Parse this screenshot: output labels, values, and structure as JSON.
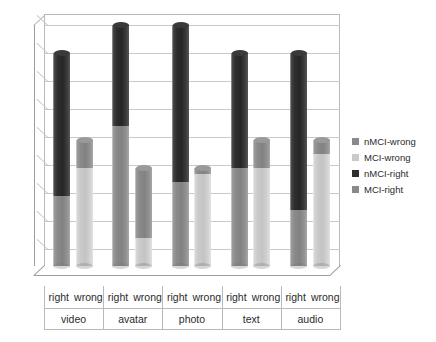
{
  "chart_data": {
    "type": "bar",
    "title": "",
    "xlabel": "",
    "ylabel": "",
    "ylim": [
      0,
      18
    ],
    "ytick_step": 2,
    "yticks": [
      18,
      16,
      14,
      12,
      10,
      8,
      6,
      4,
      2,
      0
    ],
    "grid": true,
    "stacked": true,
    "legend_position": "right",
    "groups": [
      "video",
      "avatar",
      "photo",
      "text",
      "audio"
    ],
    "subcategories": [
      "right",
      "wrong"
    ],
    "legend": [
      "nMCI-wrong",
      "MCI-wrong",
      "nMCI-right",
      "MCI-right"
    ],
    "series": [
      {
        "name": "MCI-right",
        "color": "#8a8a8a",
        "values": [
          5,
          0,
          10,
          0,
          6,
          0,
          7,
          0,
          4,
          0
        ]
      },
      {
        "name": "nMCI-right",
        "color": "#2e2e2e",
        "values": [
          10.2,
          0,
          7.2,
          0,
          11.2,
          0,
          8.2,
          0,
          11.2,
          0
        ]
      },
      {
        "name": "MCI-wrong",
        "color": "#cacaca",
        "values": [
          0,
          7,
          0,
          2,
          0,
          6.6,
          0,
          7,
          0,
          8
        ]
      },
      {
        "name": "nMCI-wrong",
        "color": "#8a8a8a",
        "values": [
          0,
          2,
          0,
          5,
          0,
          0.4,
          0,
          2,
          0,
          1
        ]
      }
    ],
    "bars": [
      {
        "group": "video",
        "sub": "right",
        "total": 15.2,
        "segments": [
          {
            "series": "MCI-right",
            "value": 5
          },
          {
            "series": "nMCI-right",
            "value": 10.2
          }
        ]
      },
      {
        "group": "video",
        "sub": "wrong",
        "total": 9,
        "segments": [
          {
            "series": "MCI-wrong",
            "value": 7
          },
          {
            "series": "nMCI-wrong",
            "value": 2
          }
        ]
      },
      {
        "group": "avatar",
        "sub": "right",
        "total": 17.2,
        "segments": [
          {
            "series": "MCI-right",
            "value": 10
          },
          {
            "series": "nMCI-right",
            "value": 7.2
          }
        ]
      },
      {
        "group": "avatar",
        "sub": "wrong",
        "total": 7,
        "segments": [
          {
            "series": "MCI-wrong",
            "value": 2
          },
          {
            "series": "nMCI-wrong",
            "value": 5
          }
        ]
      },
      {
        "group": "photo",
        "sub": "right",
        "total": 17.2,
        "segments": [
          {
            "series": "MCI-right",
            "value": 6
          },
          {
            "series": "nMCI-right",
            "value": 11.2
          }
        ]
      },
      {
        "group": "photo",
        "sub": "wrong",
        "total": 7,
        "segments": [
          {
            "series": "MCI-wrong",
            "value": 6.6
          },
          {
            "series": "nMCI-wrong",
            "value": 0.4
          }
        ]
      },
      {
        "group": "text",
        "sub": "right",
        "total": 15.2,
        "segments": [
          {
            "series": "MCI-right",
            "value": 7
          },
          {
            "series": "nMCI-right",
            "value": 8.2
          }
        ]
      },
      {
        "group": "text",
        "sub": "wrong",
        "total": 9,
        "segments": [
          {
            "series": "MCI-wrong",
            "value": 7
          },
          {
            "series": "nMCI-wrong",
            "value": 2
          }
        ]
      },
      {
        "group": "audio",
        "sub": "right",
        "total": 15.2,
        "segments": [
          {
            "series": "MCI-right",
            "value": 4
          },
          {
            "series": "nMCI-right",
            "value": 11.2
          }
        ]
      },
      {
        "group": "audio",
        "sub": "wrong",
        "total": 9,
        "segments": [
          {
            "series": "MCI-wrong",
            "value": 8
          },
          {
            "series": "nMCI-wrong",
            "value": 1
          }
        ]
      }
    ]
  },
  "colors": {
    "dark_gray": "#2e2e2e",
    "mid_gray": "#8a8a8a",
    "light_gray": "#cacaca",
    "grid": "#c9c9c9",
    "axis": "#9e9e9e",
    "text": "#2b2b2b",
    "background": "#ffffff"
  }
}
